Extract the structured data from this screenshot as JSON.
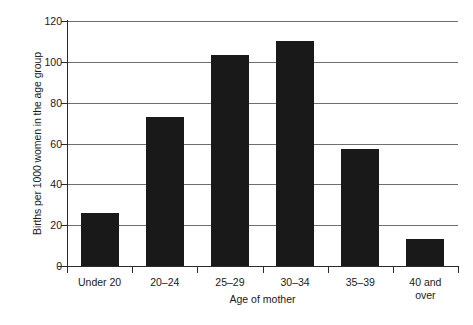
{
  "chart_data": {
    "type": "bar",
    "title": "",
    "subtitle": "",
    "xlabel": "Age of mother",
    "ylabel": "Births per 1000 women in the age group",
    "categories": [
      "Under 20",
      "20–24",
      "25–29",
      "30–34",
      "35–39",
      "40 and\nover"
    ],
    "values": [
      26,
      73,
      103.5,
      110,
      57.5,
      13
    ],
    "ylim": [
      0,
      120
    ],
    "yticks": [
      0,
      20,
      40,
      60,
      80,
      100,
      120
    ],
    "ytick_labels": [
      "0",
      "20",
      "40",
      "60",
      "80",
      "100",
      "120"
    ],
    "grid": "horizontal",
    "legend": "none",
    "bar_color": "#191919",
    "grid_color": "#6f6f6f",
    "axis_color": "#2a2a2a",
    "background_color": "#ffffff"
  }
}
